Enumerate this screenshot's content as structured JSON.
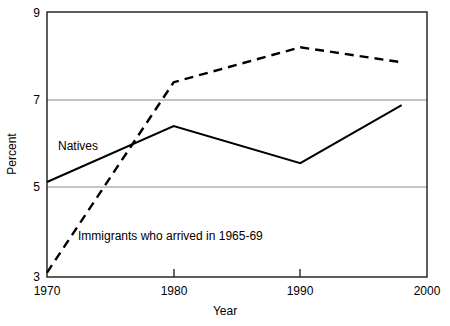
{
  "chart_data": {
    "type": "line",
    "title": "",
    "subtitle": "",
    "xlabel": "Year",
    "ylabel": "Percent",
    "xlim": [
      1970,
      2000
    ],
    "ylim": [
      3,
      9
    ],
    "xticks": [
      "1970",
      "1980",
      "1990",
      "2000"
    ],
    "xtick_values": [
      1970,
      1980,
      1990,
      2000
    ],
    "yticks": [
      "9",
      "7",
      "5",
      "3"
    ],
    "ytick_values": [
      9,
      7,
      5,
      3
    ],
    "grid": "horizontal gridlines at y = 5 and y = 7",
    "legend": "inline annotations on plot",
    "series": [
      {
        "name": "Natives",
        "style": "solid",
        "color": "#000000",
        "x": [
          1970,
          1980,
          1990,
          1998
        ],
        "values": [
          5.15,
          6.42,
          5.58,
          6.89
        ],
        "annotation": "Natives",
        "annotation_x": 1972,
        "annotation_y": 6.1
      },
      {
        "name": "Immigrants who arrived in 1965-69",
        "style": "dashed",
        "color": "#000000",
        "x": [
          1970,
          1980,
          1990,
          1998
        ],
        "values": [
          3.1,
          7.41,
          8.2,
          7.86
        ],
        "annotation": "Immigrants who arrived in 1965-69",
        "annotation_x": 1974,
        "annotation_y": 4.05
      }
    ]
  },
  "axes": {
    "y_axis_title": "Percent",
    "x_axis_title": "Year",
    "y_tick_9": "9",
    "y_tick_7": "7",
    "y_tick_5": "5",
    "y_tick_3": "3",
    "x_tick_1970": "1970",
    "x_tick_1980": "1980",
    "x_tick_1990": "1990",
    "x_tick_2000": "2000"
  },
  "annotations": {
    "natives": "Natives",
    "immigrants": "Immigrants who arrived in 1965-69"
  },
  "colors": {
    "background": "#ffffff",
    "frame": "#1a1a1a",
    "gridline": "#8c8c8c",
    "series": "#000000"
  }
}
